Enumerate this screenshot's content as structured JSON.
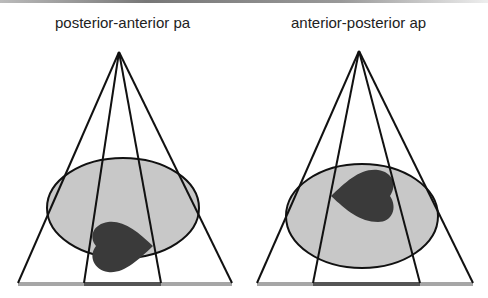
{
  "panels": [
    {
      "title": "posterior-anterior pa",
      "apex": [
        119,
        52
      ],
      "outer_base": [
        18,
        232
      ],
      "inner_base": [
        84,
        161
      ],
      "base_y": 284,
      "ellipse": {
        "cx": 123,
        "cy": 208,
        "rx": 76,
        "ry": 50
      },
      "heart": {
        "position": "near detector (bottom)",
        "direction": "points right"
      }
    },
    {
      "title": "anterior-posterior ap",
      "apex": [
        359,
        51
      ],
      "outer_base": [
        257,
        473
      ],
      "inner_base": [
        313,
        420
      ],
      "base_y": 284,
      "ellipse": {
        "cx": 362,
        "cy": 216,
        "rx": 76,
        "ry": 52
      },
      "heart": {
        "position": "near source (top)",
        "direction": "points left"
      }
    }
  ],
  "colors": {
    "line": "#111111",
    "body_fill": "#c8c8c8",
    "heart_fill": "#3a3a3a",
    "detector": "#a6a6a6",
    "shadow": "#555555"
  }
}
